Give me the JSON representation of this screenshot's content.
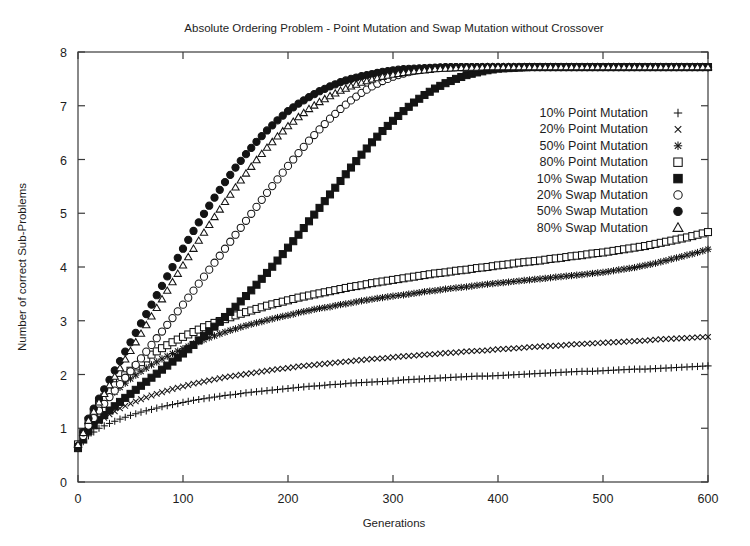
{
  "chart_data": {
    "type": "scatter",
    "title": "Absolute Ordering Problem - Point Mutation and Swap Mutation without Crossover",
    "xlabel": "Generations",
    "ylabel": "Number of correct Sub-Problems",
    "xlim": [
      0,
      600
    ],
    "ylim": [
      0,
      8
    ],
    "xticks": [
      0,
      100,
      200,
      300,
      400,
      500,
      600
    ],
    "yticks": [
      0,
      1,
      2,
      3,
      4,
      5,
      6,
      7,
      8
    ],
    "xtick_labels": [
      "0",
      "100",
      "200",
      "300",
      "400",
      "500",
      "600"
    ],
    "ytick_labels": [
      "0",
      "1",
      "2",
      "3",
      "4",
      "5",
      "6",
      "7",
      "8"
    ],
    "grid": false,
    "legend_position": "upper right",
    "x": [
      0,
      10,
      20,
      30,
      40,
      50,
      60,
      70,
      80,
      90,
      100,
      110,
      120,
      130,
      140,
      150,
      160,
      170,
      180,
      190,
      200,
      210,
      220,
      230,
      240,
      250,
      260,
      270,
      280,
      290,
      300,
      310,
      320,
      330,
      340,
      350,
      360,
      370,
      380,
      390,
      400,
      410,
      420,
      430,
      440,
      450,
      460,
      470,
      480,
      490,
      500,
      510,
      520,
      530,
      540,
      550,
      560,
      570,
      580,
      590,
      600
    ],
    "series": [
      {
        "name": "10% Point Mutation",
        "marker": "plus",
        "values": [
          0.64,
          0.86,
          1.0,
          1.09,
          1.17,
          1.24,
          1.3,
          1.35,
          1.4,
          1.44,
          1.48,
          1.52,
          1.55,
          1.58,
          1.61,
          1.63,
          1.66,
          1.68,
          1.7,
          1.72,
          1.74,
          1.76,
          1.78,
          1.79,
          1.81,
          1.82,
          1.84,
          1.85,
          1.86,
          1.87,
          1.88,
          1.9,
          1.91,
          1.92,
          1.93,
          1.94,
          1.95,
          1.96,
          1.97,
          1.97,
          1.98,
          1.99,
          2.0,
          2.01,
          2.02,
          2.03,
          2.04,
          2.05,
          2.06,
          2.06,
          2.07,
          2.08,
          2.09,
          2.1,
          2.1,
          2.11,
          2.12,
          2.13,
          2.14,
          2.15,
          2.16
        ]
      },
      {
        "name": "20% Point Mutation",
        "marker": "cross",
        "values": [
          0.66,
          0.95,
          1.13,
          1.26,
          1.37,
          1.46,
          1.54,
          1.61,
          1.67,
          1.73,
          1.78,
          1.83,
          1.87,
          1.91,
          1.95,
          1.98,
          2.01,
          2.04,
          2.07,
          2.1,
          2.12,
          2.15,
          2.17,
          2.19,
          2.21,
          2.23,
          2.25,
          2.27,
          2.29,
          2.3,
          2.32,
          2.34,
          2.35,
          2.37,
          2.38,
          2.4,
          2.41,
          2.43,
          2.44,
          2.45,
          2.47,
          2.48,
          2.49,
          2.51,
          2.52,
          2.53,
          2.54,
          2.56,
          2.57,
          2.58,
          2.59,
          2.6,
          2.61,
          2.62,
          2.63,
          2.65,
          2.66,
          2.67,
          2.68,
          2.69,
          2.7
        ]
      },
      {
        "name": "50% Point Mutation",
        "marker": "star",
        "values": [
          0.68,
          1.08,
          1.36,
          1.58,
          1.76,
          1.92,
          2.06,
          2.18,
          2.29,
          2.39,
          2.48,
          2.57,
          2.65,
          2.72,
          2.79,
          2.85,
          2.91,
          2.96,
          3.01,
          3.06,
          3.1,
          3.15,
          3.19,
          3.23,
          3.26,
          3.3,
          3.33,
          3.37,
          3.4,
          3.43,
          3.46,
          3.48,
          3.51,
          3.54,
          3.56,
          3.59,
          3.61,
          3.63,
          3.66,
          3.68,
          3.7,
          3.72,
          3.74,
          3.76,
          3.78,
          3.8,
          3.82,
          3.84,
          3.86,
          3.88,
          3.9,
          3.93,
          3.96,
          3.99,
          4.03,
          4.07,
          4.12,
          4.17,
          4.22,
          4.27,
          4.33
        ]
      },
      {
        "name": "80% Point Mutation",
        "marker": "square-open",
        "values": [
          0.7,
          1.14,
          1.45,
          1.7,
          1.9,
          2.07,
          2.23,
          2.37,
          2.49,
          2.6,
          2.7,
          2.79,
          2.88,
          2.96,
          3.03,
          3.1,
          3.16,
          3.22,
          3.28,
          3.33,
          3.38,
          3.43,
          3.47,
          3.51,
          3.55,
          3.59,
          3.63,
          3.66,
          3.7,
          3.73,
          3.76,
          3.79,
          3.82,
          3.85,
          3.88,
          3.9,
          3.93,
          3.95,
          3.98,
          4.0,
          4.03,
          4.05,
          4.08,
          4.1,
          4.12,
          4.15,
          4.17,
          4.2,
          4.22,
          4.25,
          4.27,
          4.3,
          4.33,
          4.36,
          4.39,
          4.43,
          4.47,
          4.51,
          4.55,
          4.6,
          4.65
        ]
      },
      {
        "name": "10% Swap Mutation",
        "marker": "square-filled",
        "values": [
          0.63,
          0.95,
          1.16,
          1.33,
          1.49,
          1.64,
          1.79,
          1.94,
          2.09,
          2.24,
          2.39,
          2.55,
          2.72,
          2.89,
          3.07,
          3.26,
          3.46,
          3.67,
          3.89,
          4.12,
          4.36,
          4.6,
          4.85,
          5.1,
          5.35,
          5.6,
          5.85,
          6.09,
          6.32,
          6.53,
          6.72,
          6.9,
          7.06,
          7.2,
          7.32,
          7.42,
          7.5,
          7.57,
          7.62,
          7.66,
          7.69,
          7.7,
          7.71,
          7.72,
          7.72,
          7.72,
          7.72,
          7.72,
          7.72,
          7.72,
          7.72,
          7.72,
          7.72,
          7.72,
          7.72,
          7.72,
          7.72,
          7.72,
          7.72,
          7.72,
          7.72
        ]
      },
      {
        "name": "20% Swap Mutation",
        "marker": "circle-open",
        "values": [
          0.66,
          1.05,
          1.33,
          1.58,
          1.82,
          2.06,
          2.3,
          2.55,
          2.8,
          3.05,
          3.3,
          3.56,
          3.82,
          4.08,
          4.34,
          4.6,
          4.86,
          5.12,
          5.38,
          5.63,
          5.88,
          6.12,
          6.35,
          6.56,
          6.76,
          6.94,
          7.1,
          7.24,
          7.36,
          7.46,
          7.54,
          7.6,
          7.65,
          7.68,
          7.7,
          7.71,
          7.72,
          7.72,
          7.72,
          7.72,
          7.72,
          7.72,
          7.72,
          7.72,
          7.72,
          7.72,
          7.72,
          7.72,
          7.72,
          7.72,
          7.72,
          7.72,
          7.72,
          7.72,
          7.72,
          7.72,
          7.72,
          7.72,
          7.72,
          7.72,
          7.72
        ]
      },
      {
        "name": "50% Swap Mutation",
        "marker": "circle-filled",
        "values": [
          0.67,
          1.18,
          1.55,
          1.9,
          2.25,
          2.6,
          2.95,
          3.3,
          3.65,
          4.0,
          4.34,
          4.67,
          4.99,
          5.29,
          5.58,
          5.85,
          6.1,
          6.33,
          6.54,
          6.73,
          6.9,
          7.04,
          7.16,
          7.27,
          7.36,
          7.44,
          7.5,
          7.55,
          7.59,
          7.63,
          7.66,
          7.68,
          7.69,
          7.7,
          7.71,
          7.72,
          7.72,
          7.72,
          7.72,
          7.72,
          7.72,
          7.72,
          7.72,
          7.72,
          7.72,
          7.72,
          7.72,
          7.72,
          7.72,
          7.72,
          7.72,
          7.72,
          7.72,
          7.72,
          7.72,
          7.72,
          7.72,
          7.72,
          7.72,
          7.72,
          7.72
        ]
      },
      {
        "name": "80% Swap Mutation",
        "marker": "triangle-open",
        "values": [
          0.69,
          1.14,
          1.48,
          1.8,
          2.12,
          2.44,
          2.76,
          3.08,
          3.4,
          3.72,
          4.03,
          4.34,
          4.64,
          4.93,
          5.21,
          5.48,
          5.74,
          5.99,
          6.22,
          6.43,
          6.62,
          6.79,
          6.94,
          7.07,
          7.18,
          7.28,
          7.36,
          7.43,
          7.49,
          7.54,
          7.58,
          7.61,
          7.64,
          7.66,
          7.68,
          7.69,
          7.7,
          7.71,
          7.71,
          7.72,
          7.72,
          7.72,
          7.72,
          7.72,
          7.72,
          7.72,
          7.72,
          7.72,
          7.72,
          7.72,
          7.72,
          7.72,
          7.72,
          7.72,
          7.72,
          7.72,
          7.72,
          7.72,
          7.72,
          7.72,
          7.72
        ]
      }
    ]
  },
  "legend": {
    "entries": [
      {
        "label": "10% Point Mutation",
        "marker": "plus"
      },
      {
        "label": "20% Point Mutation",
        "marker": "cross"
      },
      {
        "label": "50% Point Mutation",
        "marker": "star"
      },
      {
        "label": "80% Point Mutation",
        "marker": "square-open"
      },
      {
        "label": "10% Swap Mutation",
        "marker": "square-filled"
      },
      {
        "label": "20% Swap Mutation",
        "marker": "circle-open"
      },
      {
        "label": "50% Swap Mutation",
        "marker": "circle-filled"
      },
      {
        "label": "80% Swap Mutation",
        "marker": "triangle-open"
      }
    ]
  },
  "colors": {
    "ink": "#141414",
    "frame": "#3a3a3a",
    "background": "#ffffff"
  }
}
